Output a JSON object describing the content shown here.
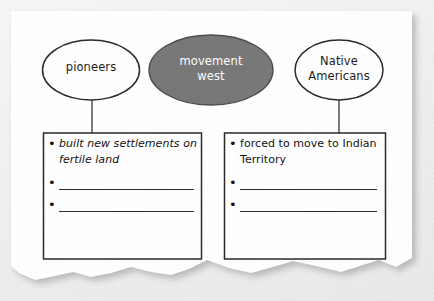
{
  "worksheet": {
    "title": "movement west concept map",
    "paper": {
      "fill": "#ffffff",
      "edge_style": "torn-bottom",
      "backdrop": "#eeeeee"
    },
    "nodes": [
      {
        "id": "pioneers",
        "label": "pioneers",
        "shape": "ellipse",
        "fill": "#ffffff",
        "stroke": "#2a2a2a",
        "text_color": "#1c1c1c",
        "role": "group"
      },
      {
        "id": "movement-west",
        "label": "movement\nwest",
        "shape": "ellipse",
        "fill": "#787878",
        "stroke": "#4a4a4a",
        "text_color": "#ffffff",
        "role": "central-topic"
      },
      {
        "id": "native-americans",
        "label": "Native\nAmericans",
        "shape": "ellipse",
        "fill": "#ffffff",
        "stroke": "#2a2a2a",
        "text_color": "#1c1c1c",
        "role": "group"
      }
    ],
    "connectors": [
      {
        "from": "pioneers",
        "to": "box-left",
        "style": "straight-line",
        "color": "#555555"
      },
      {
        "from": "native-americans",
        "to": "box-right",
        "style": "straight-line",
        "color": "#555555"
      }
    ],
    "boxes": [
      {
        "id": "box-left",
        "linked_node": "pioneers",
        "stroke": "#2a2a2a",
        "fill": "#ffffff",
        "items": [
          {
            "kind": "text",
            "text": "built new settlements on fertile land"
          },
          {
            "kind": "blank",
            "text": ""
          },
          {
            "kind": "blank",
            "text": ""
          }
        ]
      },
      {
        "id": "box-right",
        "linked_node": "native-americans",
        "stroke": "#2a2a2a",
        "fill": "#ffffff",
        "items": [
          {
            "kind": "text",
            "text": "forced to move to Indian Territory"
          },
          {
            "kind": "blank",
            "text": ""
          },
          {
            "kind": "blank",
            "text": ""
          }
        ]
      }
    ],
    "bullet_glyph": "•"
  }
}
